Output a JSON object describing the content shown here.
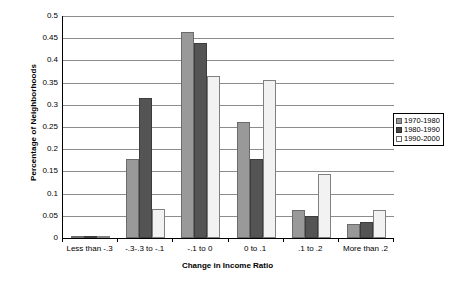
{
  "chart_data": {
    "type": "bar",
    "title": "",
    "xlabel": "Change in Income Ratio",
    "ylabel": "Percentage of Neighborhoods",
    "categories": [
      "Less than -.3",
      "-.3-.3 to -.1",
      "-.1 to 0",
      "0 to .1",
      ".1 to .2",
      "More than .2"
    ],
    "series": [
      {
        "name": "1970-1980",
        "color": "#999999",
        "values": [
          0.003,
          0.178,
          0.465,
          0.261,
          0.064,
          0.032
        ]
      },
      {
        "name": "1980-1990",
        "color": "#545454",
        "values": [
          0.002,
          0.316,
          0.44,
          0.177,
          0.05,
          0.036
        ]
      },
      {
        "name": "1990-2000",
        "color": "#f2f2f2",
        "values": [
          0.0,
          0.066,
          0.365,
          0.357,
          0.144,
          0.062
        ]
      }
    ],
    "ylim": [
      0,
      0.5
    ],
    "ytick_step": 0.05,
    "yticks": [
      0.5,
      0.45,
      0.4,
      0.35,
      0.3,
      0.25,
      0.2,
      0.15,
      0.1,
      0.05,
      0
    ],
    "ytick_labels": [
      "0.5",
      "0.45",
      "0.4",
      "0.35",
      "0.3",
      "0.25",
      "0.2",
      "0.15",
      "0.1",
      "0.05",
      "0"
    ],
    "grid": true,
    "legend_position": "right"
  },
  "legend": {
    "entries": [
      {
        "label": "1970-1980"
      },
      {
        "label": "1980-1990"
      },
      {
        "label": "1990-2000"
      }
    ]
  }
}
